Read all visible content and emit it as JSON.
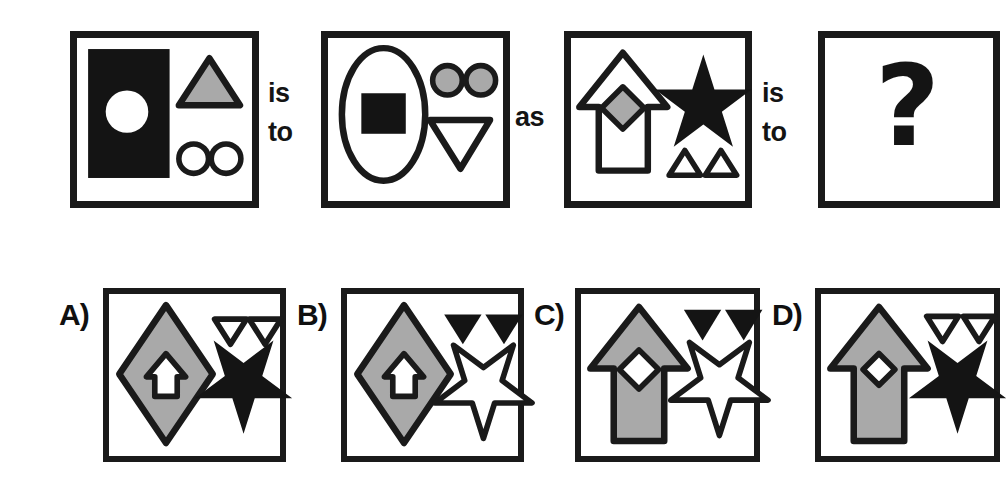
{
  "puzzle": {
    "type": "visual-analogy-multiple-choice",
    "relation_words": {
      "first_is_to": "is\nto",
      "as": "as",
      "second_is_to": "is\nto"
    },
    "question_mark": "?"
  },
  "colors": {
    "ink": "#1a1a1a",
    "fill_gray": "#a9a9a9",
    "fill_white": "#ffffff",
    "fill_black": "#141414",
    "page_background": "#ffffff"
  },
  "prompt_panels": [
    {
      "id": "panel-A1",
      "position": 1,
      "shapes": [
        {
          "name": "rectangle",
          "fill": "black",
          "outline": "none",
          "size": "large",
          "slot": "left"
        },
        {
          "name": "circle",
          "fill": "white",
          "outline": "none",
          "size": "medium",
          "slot": "inside-rectangle"
        },
        {
          "name": "triangle",
          "fill": "gray",
          "outline": "black",
          "size": "medium",
          "orientation": "up",
          "slot": "top-right"
        },
        {
          "name": "circle",
          "fill": "white",
          "outline": "black",
          "size": "small",
          "slot": "bottom-right-1"
        },
        {
          "name": "circle",
          "fill": "white",
          "outline": "black",
          "size": "small",
          "slot": "bottom-right-2"
        }
      ]
    },
    {
      "id": "panel-A2",
      "position": 2,
      "shapes": [
        {
          "name": "ellipse",
          "fill": "white",
          "outline": "black",
          "size": "large",
          "slot": "left"
        },
        {
          "name": "square",
          "fill": "black",
          "outline": "none",
          "size": "medium",
          "slot": "inside-ellipse"
        },
        {
          "name": "circle",
          "fill": "gray",
          "outline": "black",
          "size": "small",
          "slot": "top-right-1"
        },
        {
          "name": "circle",
          "fill": "gray",
          "outline": "black",
          "size": "small",
          "slot": "top-right-2"
        },
        {
          "name": "triangle",
          "fill": "white",
          "outline": "black",
          "size": "medium",
          "orientation": "down",
          "slot": "bottom-right"
        }
      ]
    },
    {
      "id": "panel-B1",
      "position": 3,
      "shapes": [
        {
          "name": "arrow",
          "fill": "white",
          "outline": "black",
          "size": "large",
          "orientation": "up",
          "slot": "left"
        },
        {
          "name": "diamond",
          "fill": "gray",
          "outline": "black",
          "size": "small",
          "slot": "inside-arrow"
        },
        {
          "name": "star",
          "fill": "black",
          "outline": "none",
          "size": "large",
          "orientation": "up",
          "slot": "top-right"
        },
        {
          "name": "triangle",
          "fill": "white",
          "outline": "black",
          "size": "tiny",
          "orientation": "up",
          "slot": "bottom-right-1"
        },
        {
          "name": "triangle",
          "fill": "white",
          "outline": "black",
          "size": "tiny",
          "orientation": "up",
          "slot": "bottom-right-2"
        }
      ]
    },
    {
      "id": "panel-B2",
      "position": 4,
      "content": "question-mark"
    }
  ],
  "options": [
    {
      "id": "option-a",
      "label": "A)",
      "shapes": [
        {
          "name": "diamond",
          "fill": "gray",
          "outline": "black",
          "size": "large",
          "slot": "left"
        },
        {
          "name": "arrow",
          "fill": "white",
          "outline": "black",
          "size": "small",
          "orientation": "up",
          "slot": "inside-diamond"
        },
        {
          "name": "triangle",
          "fill": "white",
          "outline": "black",
          "size": "tiny",
          "orientation": "down",
          "slot": "top-right-1"
        },
        {
          "name": "triangle",
          "fill": "white",
          "outline": "black",
          "size": "tiny",
          "orientation": "down",
          "slot": "top-right-2"
        },
        {
          "name": "star",
          "fill": "black",
          "outline": "none",
          "size": "large",
          "orientation": "down",
          "slot": "bottom-right"
        }
      ]
    },
    {
      "id": "option-b",
      "label": "B)",
      "shapes": [
        {
          "name": "diamond",
          "fill": "gray",
          "outline": "black",
          "size": "large",
          "slot": "left"
        },
        {
          "name": "arrow",
          "fill": "white",
          "outline": "black",
          "size": "small",
          "orientation": "up",
          "slot": "inside-diamond"
        },
        {
          "name": "triangle",
          "fill": "black",
          "outline": "none",
          "size": "tiny",
          "orientation": "down",
          "slot": "top-right-1"
        },
        {
          "name": "triangle",
          "fill": "black",
          "outline": "none",
          "size": "tiny",
          "orientation": "down",
          "slot": "top-right-2"
        },
        {
          "name": "star",
          "fill": "white",
          "outline": "black",
          "size": "large",
          "orientation": "down",
          "slot": "bottom-right"
        }
      ]
    },
    {
      "id": "option-c",
      "label": "C)",
      "shapes": [
        {
          "name": "arrow",
          "fill": "gray",
          "outline": "black",
          "size": "large",
          "orientation": "up",
          "slot": "left"
        },
        {
          "name": "diamond",
          "fill": "white",
          "outline": "black",
          "size": "small",
          "slot": "inside-arrow"
        },
        {
          "name": "triangle",
          "fill": "black",
          "outline": "none",
          "size": "tiny",
          "orientation": "down",
          "slot": "top-right-1"
        },
        {
          "name": "triangle",
          "fill": "black",
          "outline": "none",
          "size": "tiny",
          "orientation": "down",
          "slot": "top-right-2"
        },
        {
          "name": "star",
          "fill": "white",
          "outline": "black",
          "size": "large",
          "orientation": "down",
          "slot": "bottom-right"
        }
      ]
    },
    {
      "id": "option-d",
      "label": "D)",
      "shapes": [
        {
          "name": "arrow",
          "fill": "gray",
          "outline": "black",
          "size": "large",
          "orientation": "up",
          "slot": "left"
        },
        {
          "name": "diamond",
          "fill": "white",
          "outline": "black",
          "size": "small",
          "slot": "inside-arrow"
        },
        {
          "name": "triangle",
          "fill": "white",
          "outline": "black",
          "size": "tiny",
          "orientation": "down",
          "slot": "top-right-1"
        },
        {
          "name": "triangle",
          "fill": "white",
          "outline": "black",
          "size": "tiny",
          "orientation": "down",
          "slot": "top-right-2"
        },
        {
          "name": "star",
          "fill": "black",
          "outline": "none",
          "size": "large",
          "orientation": "down",
          "slot": "bottom-right"
        }
      ]
    }
  ]
}
